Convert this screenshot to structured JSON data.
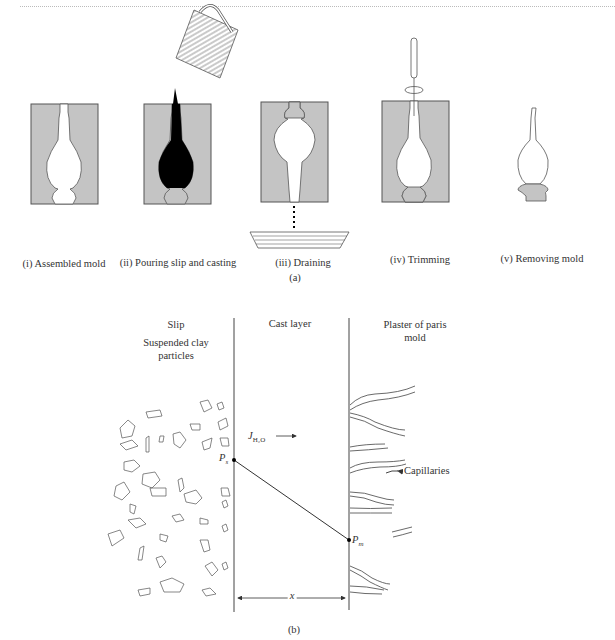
{
  "panel_a": {
    "caption": "(a)",
    "steps": [
      {
        "label": "(i) Assembled mold"
      },
      {
        "label": "(ii) Pouring slip and casting"
      },
      {
        "label": "(iii) Draining"
      },
      {
        "label": "(iv) Trimming"
      },
      {
        "label": "(v) Removing mold"
      }
    ],
    "colors": {
      "mold_fill": "#c4c4c4",
      "slip_fill": "#000000",
      "outline": "#555555"
    }
  },
  "panel_b": {
    "caption": "(b)",
    "region_labels": {
      "slip": "Slip",
      "particles": "Suspended clay particles",
      "cast_layer": "Cast layer",
      "mold": "Plaster of paris mold"
    },
    "flux_label": "J",
    "flux_subscript": "H₂O",
    "pressure_slip": "P",
    "pressure_slip_sub": "s",
    "pressure_mold": "P",
    "pressure_mold_sub": "m",
    "thickness_label": "x",
    "capillaries_label": "Capillaries"
  }
}
